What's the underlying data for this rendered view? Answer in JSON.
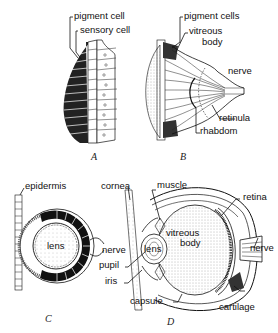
{
  "panels": {
    "A": {
      "caption": "A",
      "labels": [
        "pigment cell",
        "sensory cell"
      ]
    },
    "B": {
      "caption": "B",
      "labels": [
        "pigment cells",
        "vitreous",
        "body",
        "nerve",
        "retinula",
        "rhabdom"
      ]
    },
    "C": {
      "caption": "C",
      "labels": [
        "epidermis",
        "lens",
        "nerve"
      ]
    },
    "D": {
      "caption": "D",
      "labels": [
        "cornea",
        "muscle",
        "retina",
        "vitreous",
        "body",
        "lens",
        "pupil",
        "iris",
        "nerve",
        "capsule",
        "cartilage"
      ]
    }
  },
  "colors": {
    "ink": "#111111",
    "background": "#ffffff",
    "stipple": "#9a9a9a"
  }
}
